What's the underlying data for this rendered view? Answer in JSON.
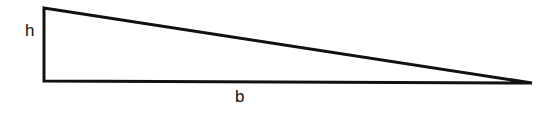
{
  "figure": {
    "type": "geometry-diagram",
    "shape": "right-triangle",
    "background_color": "#ffffff",
    "stroke_color": "#111111",
    "stroke_width": 3,
    "vertices": {
      "top_left": [
        44,
        8
      ],
      "bottom_left": [
        44,
        81
      ],
      "apex_right": [
        532,
        83
      ]
    },
    "edges": [
      {
        "name": "height-leg",
        "from": "top_left",
        "to": "bottom_left",
        "label": "h"
      },
      {
        "name": "base-leg",
        "from": "bottom_left",
        "to": "apex_right",
        "label": "b"
      },
      {
        "name": "hypotenuse",
        "from": "top_left",
        "to": "apex_right",
        "label": ""
      }
    ]
  },
  "labels": {
    "height": "h",
    "base": "b"
  }
}
